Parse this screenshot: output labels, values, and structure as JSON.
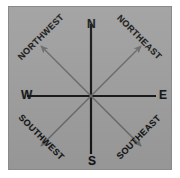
{
  "figure": {
    "kind": "compass-rose",
    "panel_bg": "#9e9e9e",
    "panel_border": "#8a8a8a",
    "page_bg": "#ffffff"
  },
  "compass": {
    "center": {
      "x": 82,
      "y": 89
    },
    "cardinal": {
      "color": "#141414",
      "line_width": 2.2,
      "points": [
        {
          "key": "north",
          "label": "N",
          "bearing_deg": 0,
          "axis": "vertical"
        },
        {
          "key": "east",
          "label": "E",
          "bearing_deg": 90,
          "axis": "horizontal"
        },
        {
          "key": "south",
          "label": "S",
          "bearing_deg": 180,
          "axis": "vertical"
        },
        {
          "key": "west",
          "label": "W",
          "bearing_deg": 270,
          "axis": "horizontal"
        }
      ]
    },
    "ordinal": {
      "color": "#6a6a6a",
      "line_width": 1.6,
      "arrowhead": true,
      "points": [
        {
          "key": "northwest",
          "label": "NORTHWEST",
          "bearing_deg": 315,
          "text_rotation_deg": -45
        },
        {
          "key": "northeast",
          "label": "NORTHEAST",
          "bearing_deg": 45,
          "text_rotation_deg": 45
        },
        {
          "key": "southwest",
          "label": "SOUTHWEST",
          "bearing_deg": 225,
          "text_rotation_deg": 45
        },
        {
          "key": "southeast",
          "label": "SOUTHEAST",
          "bearing_deg": 135,
          "text_rotation_deg": -45
        }
      ]
    }
  }
}
